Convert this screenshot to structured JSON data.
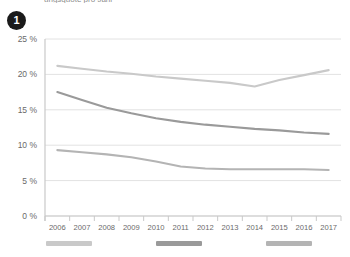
{
  "header": {
    "cropped_title": "ungsquote pro Jahr",
    "badge_number": "1"
  },
  "legend": {
    "items": [
      {
        "label": "",
        "color": "#c9c9c9",
        "x": 46
      },
      {
        "label": "",
        "color": "#9a9a9a",
        "x": 156
      },
      {
        "label": "",
        "color": "#b4b4b4",
        "x": 266
      }
    ]
  },
  "chart_data": {
    "type": "line",
    "title": "",
    "xlabel": "",
    "ylabel": "",
    "ylim": [
      0,
      25
    ],
    "ytick_labels": [
      "0 %",
      "5 %",
      "10 %",
      "15 %",
      "20 %",
      "25 %"
    ],
    "ytick_values": [
      0,
      5,
      10,
      15,
      20,
      25
    ],
    "grid": true,
    "legend_position": "bottom",
    "categories": [
      "2006",
      "2007",
      "2008",
      "2009",
      "2010",
      "2011",
      "2012",
      "2013",
      "2014",
      "2015",
      "2016",
      "2017"
    ],
    "series": [
      {
        "name": "series-1",
        "color": "#c9c9c9",
        "values": [
          21.2,
          20.8,
          20.4,
          20.1,
          19.7,
          19.4,
          19.1,
          18.8,
          18.3,
          19.2,
          19.9,
          20.6
        ]
      },
      {
        "name": "series-2",
        "color": "#9a9a9a",
        "values": [
          17.5,
          16.4,
          15.3,
          14.5,
          13.8,
          13.3,
          12.9,
          12.6,
          12.3,
          12.1,
          11.8,
          11.6
        ]
      },
      {
        "name": "series-3",
        "color": "#b4b4b4",
        "values": [
          9.3,
          9.0,
          8.7,
          8.3,
          7.7,
          7.0,
          6.7,
          6.6,
          6.6,
          6.6,
          6.6,
          6.5
        ]
      }
    ]
  }
}
